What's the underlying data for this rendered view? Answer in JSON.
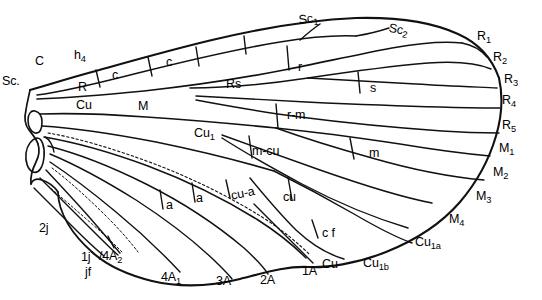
{
  "figure": {
    "ink_color": "#000000",
    "background_color": "#ffffff",
    "line_color": "#1a1a1a"
  },
  "labels": {
    "costal_margin": [
      {
        "id": "C",
        "text": "C",
        "sub": "",
        "x": 35,
        "y": 62,
        "rot": 0,
        "size": "normal"
      },
      {
        "id": "h4",
        "text": "h",
        "sub": "4",
        "x": 74,
        "y": 56,
        "rot": 0,
        "size": "normal"
      },
      {
        "id": "Sc1",
        "text": "Sc",
        "sub": "1",
        "x": 298,
        "y": 20,
        "rot": -8,
        "size": "normal"
      },
      {
        "id": "Sc2",
        "text": "Sc",
        "sub": "2",
        "x": 390,
        "y": 28,
        "rot": 10,
        "size": "normal"
      }
    ],
    "basal_veins": [
      {
        "id": "Sc",
        "text": "Sc.",
        "sub": "",
        "x": 4,
        "y": 82,
        "rot": 0,
        "size": "normal"
      },
      {
        "id": "R",
        "text": "R",
        "sub": "",
        "x": 78,
        "y": 87,
        "rot": 0,
        "size": "normal"
      },
      {
        "id": "M",
        "text": "M",
        "sub": "",
        "x": 138,
        "y": 107,
        "rot": 0,
        "size": "normal"
      },
      {
        "id": "Cu",
        "text": "Cu",
        "sub": "",
        "x": 78,
        "y": 106,
        "rot": 0,
        "size": "normal"
      }
    ],
    "cells": [
      {
        "id": "c1",
        "text": "c",
        "sub": "",
        "x": 113,
        "y": 76,
        "rot": 0,
        "size": "normal"
      },
      {
        "id": "c2",
        "text": "c",
        "sub": "",
        "x": 167,
        "y": 62,
        "rot": 0,
        "size": "normal"
      },
      {
        "id": "Rs",
        "text": "Rs",
        "sub": "",
        "x": 228,
        "y": 84,
        "rot": 0,
        "size": "normal"
      },
      {
        "id": "r",
        "text": "r",
        "sub": "",
        "x": 298,
        "y": 68,
        "rot": 0,
        "size": "normal"
      },
      {
        "id": "s",
        "text": "s",
        "sub": "",
        "x": 371,
        "y": 89,
        "rot": 0,
        "size": "normal"
      },
      {
        "id": "rm",
        "text": "r-m",
        "sub": "",
        "x": 289,
        "y": 115,
        "rot": 0,
        "size": "normal"
      },
      {
        "id": "Cu1",
        "text": "Cu",
        "sub": "1",
        "x": 196,
        "y": 134,
        "rot": 0,
        "size": "normal"
      },
      {
        "id": "mcu",
        "text": "m-cu",
        "sub": "",
        "x": 253,
        "y": 151,
        "rot": 0,
        "size": "normal"
      },
      {
        "id": "m",
        "text": "m",
        "sub": "",
        "x": 370,
        "y": 154,
        "rot": 0,
        "size": "normal"
      },
      {
        "id": "cu",
        "text": "cu",
        "sub": "",
        "x": 283,
        "y": 198,
        "rot": 0,
        "size": "normal"
      },
      {
        "id": "cua",
        "text": "cu-a",
        "sub": "",
        "x": 231,
        "y": 196,
        "rot": -12,
        "size": "normal"
      },
      {
        "id": "a1",
        "text": "a",
        "sub": "",
        "x": 166,
        "y": 206,
        "rot": 0,
        "size": "normal"
      },
      {
        "id": "a2",
        "text": "a",
        "sub": "",
        "x": 197,
        "y": 199,
        "rot": 0,
        "size": "normal"
      },
      {
        "id": "cf",
        "text": "c f",
        "sub": "",
        "x": 323,
        "y": 233,
        "rot": 0,
        "size": "normal"
      }
    ],
    "posterior_margin": [
      {
        "id": "2j",
        "text": "2j",
        "sub": "",
        "x": 40,
        "y": 229,
        "rot": 0,
        "size": "normal"
      },
      {
        "id": "1j",
        "text": "1j",
        "sub": "",
        "x": 82,
        "y": 258,
        "rot": 0,
        "size": "normal"
      },
      {
        "id": "jf",
        "text": "jf",
        "sub": "",
        "x": 86,
        "y": 272,
        "rot": 0,
        "size": "normal"
      },
      {
        "id": "4A2",
        "text": "/4A",
        "sub": "2",
        "x": 101,
        "y": 257,
        "rot": 0,
        "size": "normal"
      },
      {
        "id": "4A1",
        "text": "4A",
        "sub": "1",
        "x": 163,
        "y": 277,
        "rot": 0,
        "size": "normal"
      },
      {
        "id": "3A",
        "text": "3A",
        "sub": "",
        "x": 218,
        "y": 281,
        "rot": 0,
        "size": "normal"
      },
      {
        "id": "2A",
        "text": "2A",
        "sub": "",
        "x": 262,
        "y": 280,
        "rot": 0,
        "size": "normal"
      },
      {
        "id": "1A",
        "text": "1A",
        "sub": "",
        "x": 304,
        "y": 271,
        "rot": 0,
        "size": "normal"
      },
      {
        "id": "CuA",
        "text": "Cu",
        "sub": "",
        "x": 322,
        "y": 265,
        "rot": 0,
        "size": "normal"
      },
      {
        "id": "Cu1b",
        "text": "Cu",
        "sub": "1b",
        "x": 365,
        "y": 264,
        "rot": 0,
        "size": "normal"
      },
      {
        "id": "Cu1a",
        "text": "Cu",
        "sub": "1a",
        "x": 417,
        "y": 243,
        "rot": 0,
        "size": "normal"
      }
    ],
    "apical_margin": [
      {
        "id": "R1",
        "text": "R",
        "sub": "1",
        "x": 478,
        "y": 36,
        "rot": 0,
        "size": "normal"
      },
      {
        "id": "R2",
        "text": "R",
        "sub": "2",
        "x": 494,
        "y": 57,
        "rot": 0,
        "size": "normal"
      },
      {
        "id": "R3",
        "text": "R",
        "sub": "3",
        "x": 505,
        "y": 79,
        "rot": 0,
        "size": "normal"
      },
      {
        "id": "R4",
        "text": "R",
        "sub": "4",
        "x": 503,
        "y": 100,
        "rot": 0,
        "size": "normal"
      },
      {
        "id": "R5",
        "text": "R",
        "sub": "5",
        "x": 503,
        "y": 125,
        "rot": 0,
        "size": "normal"
      },
      {
        "id": "M1",
        "text": "M",
        "sub": "1",
        "x": 500,
        "y": 148,
        "rot": 0,
        "size": "normal"
      },
      {
        "id": "M2",
        "text": "M",
        "sub": "2",
        "x": 494,
        "y": 172,
        "rot": 0,
        "size": "normal"
      },
      {
        "id": "M3",
        "text": "M",
        "sub": "3",
        "x": 477,
        "y": 196,
        "rot": 0,
        "size": "normal"
      },
      {
        "id": "M4",
        "text": "M",
        "sub": "4",
        "x": 450,
        "y": 219,
        "rot": 0,
        "size": "normal"
      }
    ]
  }
}
